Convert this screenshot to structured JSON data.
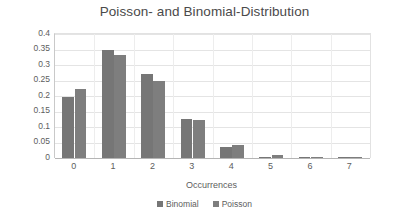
{
  "chart_data": {
    "type": "bar",
    "title": "Poisson- and Binomial-Distribution",
    "xlabel": "Occurrences",
    "ylabel": "Probability",
    "categories": [
      "0",
      "1",
      "2",
      "3",
      "4",
      "5",
      "6",
      "7"
    ],
    "series": [
      {
        "name": "Binomial",
        "color": "#767676",
        "values": [
          0.196,
          0.347,
          0.272,
          0.127,
          0.036,
          0.004,
          0.0005,
          0.0001
        ]
      },
      {
        "name": "Poisson",
        "color": "#7e7e7e",
        "values": [
          0.223,
          0.333,
          0.249,
          0.122,
          0.042,
          0.009,
          0.0015,
          0.0003
        ]
      }
    ],
    "ylim": [
      0,
      0.4
    ],
    "yticks": [
      "0",
      "0.05",
      "0.1",
      "0.15",
      "0.2",
      "0.25",
      "0.3",
      "0.35",
      "0.4"
    ],
    "ytick_values": [
      0,
      0.05,
      0.1,
      0.15,
      0.2,
      0.25,
      0.3,
      0.35,
      0.4
    ],
    "grid": true,
    "legend_position": "bottom"
  }
}
